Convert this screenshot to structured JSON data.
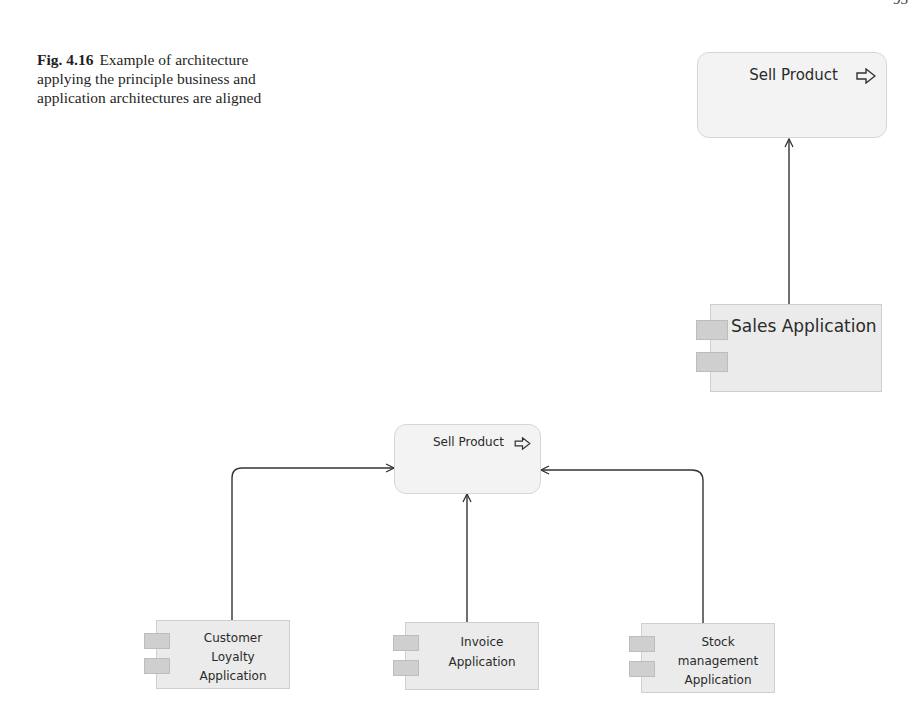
{
  "page": {
    "number": "93"
  },
  "caption": {
    "label": "Fig. 4.16",
    "text": "Example of architecture applying the principle business and application architectures are aligned"
  },
  "diagram_top": {
    "process": {
      "label": "Sell Product",
      "icon": "process-arrow-icon"
    },
    "component": {
      "label": "Sales Application",
      "icon": "component-icon"
    },
    "relations": [
      {
        "from": "Sales Application",
        "to": "Sell Product",
        "type": "serving"
      }
    ]
  },
  "diagram_bottom": {
    "process": {
      "label": "Sell Product",
      "icon": "process-arrow-icon"
    },
    "components": [
      {
        "lines": [
          "Customer",
          "Loyalty",
          "Application"
        ],
        "icon": "component-icon"
      },
      {
        "lines": [
          "Invoice",
          "Application"
        ],
        "icon": "component-icon"
      },
      {
        "lines": [
          "Stock",
          "management",
          "Application"
        ],
        "icon": "component-icon"
      }
    ],
    "relations": [
      {
        "from": "Customer Loyalty Application",
        "to": "Sell Product",
        "type": "serving"
      },
      {
        "from": "Invoice Application",
        "to": "Sell Product",
        "type": "serving"
      },
      {
        "from": "Stock management Application",
        "to": "Sell Product",
        "type": "serving"
      }
    ]
  }
}
